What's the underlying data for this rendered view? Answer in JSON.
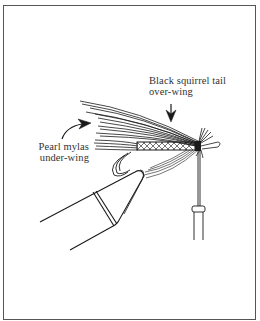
{
  "diagram": {
    "labels": [
      {
        "id": "over_wing",
        "line1": "Black squirrel tail",
        "line2": "over-wing"
      },
      {
        "id": "under_wing",
        "line1": "Pearl mylas",
        "line2": "under-wing"
      }
    ],
    "colors": {
      "ink": "#1a1a1a",
      "frame": "#555555",
      "background": "#ffffff",
      "text": "#333333"
    }
  }
}
